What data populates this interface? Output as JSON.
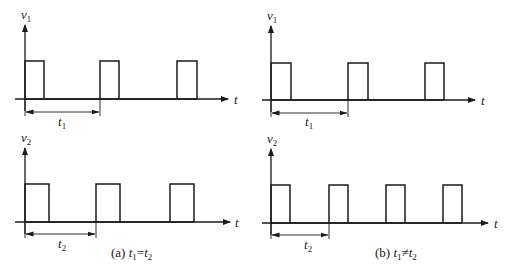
{
  "colors": {
    "ink": "#1a1a1a",
    "background": "#ffffff"
  },
  "panels": [
    {
      "id": "top-left",
      "axis_label": "v",
      "axis_sub": "1",
      "origin_x": 25,
      "baseline_y": 99,
      "high_y": 61,
      "axis_top_y": 25,
      "axis_end_x": 228,
      "axis_start_x": 15,
      "t_label": "t",
      "t_label_x": 234,
      "pulses": [
        [
          25,
          44
        ],
        [
          100,
          119
        ],
        [
          177,
          197
        ]
      ],
      "dim": {
        "x1": 25,
        "x2": 100,
        "y": 112,
        "label": "t",
        "label_sub": "1",
        "label_x": 58,
        "label_y": 126
      }
    },
    {
      "id": "bottom-left",
      "axis_label": "v",
      "axis_sub": "2",
      "origin_x": 25,
      "baseline_y": 222,
      "high_y": 184,
      "axis_top_y": 148,
      "axis_end_x": 230,
      "axis_start_x": 15,
      "t_label": "t",
      "t_label_x": 235,
      "pulses": [
        [
          25,
          49
        ],
        [
          96,
          120
        ],
        [
          170,
          194
        ]
      ],
      "dim": {
        "x1": 25,
        "x2": 96,
        "y": 234,
        "label": "t",
        "label_sub": "2",
        "label_x": 58,
        "label_y": 248
      }
    },
    {
      "id": "top-right",
      "axis_label": "v",
      "axis_sub": "1",
      "origin_x": 271,
      "baseline_y": 100,
      "high_y": 63,
      "axis_top_y": 26,
      "axis_end_x": 475,
      "axis_start_x": 262,
      "t_label": "t",
      "t_label_x": 481,
      "pulses": [
        [
          271,
          291
        ],
        [
          348,
          368
        ],
        [
          425,
          444
        ]
      ],
      "dim": {
        "x1": 271,
        "x2": 348,
        "y": 113,
        "label": "t",
        "label_sub": "1",
        "label_x": 305,
        "label_y": 126
      }
    },
    {
      "id": "bottom-right",
      "axis_label": "v",
      "axis_sub": "2",
      "origin_x": 271,
      "baseline_y": 223,
      "high_y": 185,
      "axis_top_y": 149,
      "axis_end_x": 488,
      "axis_start_x": 262,
      "t_label": "t",
      "t_label_x": 494,
      "pulses": [
        [
          271,
          290
        ],
        [
          329,
          348
        ],
        [
          386,
          405
        ],
        [
          443,
          462
        ]
      ],
      "dim": {
        "x1": 271,
        "x2": 329,
        "y": 235,
        "label": "t",
        "label_sub": "2",
        "label_x": 304,
        "label_y": 249
      }
    }
  ],
  "captions": [
    {
      "id": "a",
      "prefix": "(a) ",
      "var1": "t",
      "sub1": "1",
      "op": "=",
      "var2": "t",
      "sub2": "2",
      "x": 111,
      "y": 257
    },
    {
      "id": "b",
      "prefix": "(b) ",
      "var1": "t",
      "sub1": "1",
      "op": "≠",
      "var2": "t",
      "sub2": "2",
      "x": 375,
      "y": 257
    }
  ]
}
